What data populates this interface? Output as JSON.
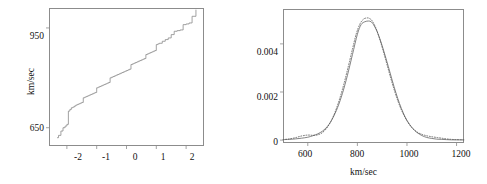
{
  "figure": {
    "width": 487,
    "height": 184,
    "background": "#ffffff",
    "line_color": "#8a8a8a",
    "frame_color": "#8c8c8c",
    "text_color": "#111111"
  },
  "chart_data": [
    {
      "type": "line",
      "name": "normal-quantile-plot",
      "title": "",
      "xlabel": "",
      "ylabel": "km/sec",
      "xlim": [
        -2.6,
        2.6
      ],
      "ylim": [
        595,
        1010
      ],
      "grid": false,
      "legend": null,
      "xticks": [
        -2,
        -1,
        0,
        1,
        2
      ],
      "xtick_labels": [
        "-2",
        "-1",
        "0",
        "1",
        "2"
      ],
      "yticks": [
        650,
        950
      ],
      "ytick_labels": [
        "650",
        "950"
      ],
      "series": [
        {
          "name": "sample-quantiles",
          "style": "step",
          "x": [
            -2.33,
            -2.28,
            -2.2,
            -2.13,
            -2.06,
            -2.0,
            -1.95,
            -1.9,
            -1.85,
            -1.8,
            -1.75,
            -1.7,
            -1.65,
            -1.6,
            -1.55,
            -1.5,
            -1.45,
            -1.4,
            -1.35,
            -1.3,
            -1.25,
            -1.2,
            -1.15,
            -1.1,
            -1.05,
            -1.0,
            -0.95,
            -0.9,
            -0.85,
            -0.8,
            -0.75,
            -0.7,
            -0.65,
            -0.6,
            -0.55,
            -0.5,
            -0.45,
            -0.4,
            -0.35,
            -0.3,
            -0.25,
            -0.2,
            -0.15,
            -0.1,
            -0.05,
            0.0,
            0.05,
            0.1,
            0.15,
            0.2,
            0.25,
            0.3,
            0.35,
            0.4,
            0.45,
            0.5,
            0.55,
            0.6,
            0.65,
            0.7,
            0.75,
            0.8,
            0.85,
            0.9,
            0.95,
            1.0,
            1.05,
            1.1,
            1.2,
            1.3,
            1.4,
            1.5,
            1.6,
            1.7,
            1.8,
            1.9,
            2.0,
            2.1,
            2.2,
            2.33
          ],
          "y": [
            620,
            627,
            640,
            650,
            655,
            660,
            700,
            705,
            710,
            712,
            715,
            718,
            720,
            722,
            724,
            726,
            740,
            742,
            744,
            746,
            748,
            750,
            752,
            754,
            756,
            770,
            772,
            774,
            776,
            778,
            780,
            782,
            784,
            786,
            800,
            802,
            804,
            806,
            808,
            810,
            812,
            814,
            816,
            818,
            820,
            822,
            824,
            826,
            840,
            842,
            844,
            846,
            848,
            850,
            852,
            854,
            856,
            858,
            870,
            872,
            874,
            876,
            878,
            880,
            882,
            900,
            902,
            904,
            910,
            915,
            920,
            930,
            940,
            942,
            944,
            960,
            962,
            965,
            985,
            1005
          ]
        }
      ]
    },
    {
      "type": "line",
      "name": "density-comparison-plot",
      "title": "",
      "xlabel": "km/sec",
      "ylabel": "",
      "xlim": [
        500,
        1230
      ],
      "ylim": [
        -0.00012,
        0.00545
      ],
      "grid": false,
      "legend": null,
      "xticks": [
        600,
        800,
        1000,
        1200
      ],
      "xtick_labels": [
        "600",
        "800",
        "1000",
        "1200"
      ],
      "yticks": [
        0,
        0.002,
        0.004
      ],
      "ytick_labels": [
        "0",
        "0.002",
        "0.004"
      ],
      "series": [
        {
          "name": "solid-density",
          "style": "solid",
          "x": [
            500,
            525,
            550,
            575,
            600,
            620,
            640,
            660,
            680,
            700,
            720,
            740,
            760,
            780,
            800,
            815,
            830,
            845,
            855,
            865,
            880,
            895,
            910,
            925,
            940,
            955,
            970,
            985,
            1000,
            1020,
            1040,
            1060,
            1080,
            1100,
            1120,
            1140,
            1160,
            1180,
            1200,
            1230
          ],
          "y": [
            2e-05,
            3e-05,
            5e-05,
            8e-05,
            0.00012,
            0.00018,
            0.00026,
            0.00038,
            0.00058,
            0.0009,
            0.00135,
            0.00195,
            0.0027,
            0.00355,
            0.0044,
            0.0048,
            0.00492,
            0.00495,
            0.00492,
            0.0048,
            0.0045,
            0.00408,
            0.00358,
            0.00305,
            0.0025,
            0.00198,
            0.00152,
            0.00113,
            0.00082,
            0.00052,
            0.00032,
            0.00019,
            0.00011,
            7e-05,
            4e-05,
            3e-05,
            2e-05,
            1e-05,
            1e-05,
            1e-05
          ]
        },
        {
          "name": "dotted-density",
          "style": "dotted",
          "x": [
            500,
            525,
            550,
            570,
            590,
            605,
            620,
            640,
            660,
            680,
            700,
            720,
            740,
            760,
            780,
            795,
            810,
            825,
            840,
            850,
            860,
            875,
            890,
            905,
            920,
            935,
            950,
            965,
            980,
            1000,
            1020,
            1040,
            1060,
            1080,
            1100,
            1120,
            1140,
            1160,
            1180,
            1200,
            1230
          ],
          "y": [
            2e-05,
            5e-05,
            0.0001,
            0.00016,
            0.0002,
            0.00021,
            0.0002,
            0.00022,
            0.00032,
            0.00055,
            0.00092,
            0.00145,
            0.00212,
            0.00292,
            0.00378,
            0.0044,
            0.00482,
            0.00503,
            0.00508,
            0.00505,
            0.00495,
            0.00465,
            0.0042,
            0.00368,
            0.00312,
            0.00256,
            0.00204,
            0.00158,
            0.0012,
            0.0008,
            0.00052,
            0.00034,
            0.00024,
            0.00018,
            0.00014,
            0.00011,
            8e-05,
            5e-05,
            3e-05,
            2e-05,
            1e-05
          ]
        }
      ]
    }
  ],
  "left_panel": {
    "y_axis_title": "km/sec",
    "y_tick_labels": [
      "950",
      "650"
    ],
    "x_tick_labels": [
      "-2",
      "-1",
      "0",
      "1",
      "2"
    ]
  },
  "right_panel": {
    "x_axis_title": "km/sec",
    "y_tick_labels": [
      "0.004",
      "0.002",
      "0"
    ],
    "x_tick_labels": [
      "600",
      "800",
      "1000",
      "1200"
    ]
  }
}
